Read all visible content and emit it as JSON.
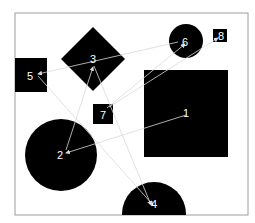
{
  "diagram": {
    "frame": {
      "x": 15,
      "y": 13,
      "width": 233,
      "height": 202,
      "stroke": "#9e9e9e"
    },
    "colors": {
      "shape_fill": "#000000",
      "label": "#ffffff",
      "edge": "#d9d9d9",
      "background": "#ffffff"
    },
    "nodes": [
      {
        "id": "1",
        "label": "1",
        "shape": "square",
        "x": 144,
        "y": 70,
        "w": 84,
        "h": 87,
        "lx": 186,
        "ly": 117
      },
      {
        "id": "2",
        "label": "2",
        "shape": "circle",
        "cx": 61,
        "cy": 155,
        "r": 36,
        "lx": 60,
        "ly": 159
      },
      {
        "id": "3",
        "label": "3",
        "shape": "diamond",
        "cx": 93,
        "cy": 59,
        "r": 32,
        "lx": 93,
        "ly": 63
      },
      {
        "id": "4",
        "label": "4",
        "shape": "circle",
        "cx": 154,
        "cy": 214,
        "r": 32,
        "lx": 154,
        "ly": 208
      },
      {
        "id": "5",
        "label": "5",
        "shape": "square",
        "x": 15,
        "y": 58,
        "w": 32,
        "h": 34,
        "lx": 30,
        "ly": 80
      },
      {
        "id": "6",
        "label": "6",
        "shape": "circle",
        "cx": 186,
        "cy": 41,
        "r": 17,
        "lx": 185,
        "ly": 46
      },
      {
        "id": "7",
        "label": "7",
        "shape": "square",
        "x": 93,
        "y": 104,
        "w": 20,
        "h": 20,
        "lx": 103,
        "ly": 119
      },
      {
        "id": "8",
        "label": "8",
        "shape": "square",
        "x": 213,
        "y": 29,
        "w": 14,
        "h": 13,
        "lx": 221,
        "ly": 40
      }
    ],
    "edges": [
      {
        "from": "1",
        "to": "2",
        "x1": 186,
        "y1": 115,
        "x2": 66,
        "y2": 153
      },
      {
        "from": "2",
        "to": "3",
        "x1": 66,
        "y1": 150,
        "x2": 93,
        "y2": 67
      },
      {
        "from": "6",
        "to": "5",
        "x1": 178,
        "y1": 42,
        "x2": 38,
        "y2": 74
      },
      {
        "from": "5",
        "to": "4",
        "x1": 38,
        "y1": 76,
        "x2": 153,
        "y2": 205
      },
      {
        "from": "3",
        "to": "4",
        "x1": 94,
        "y1": 66,
        "x2": 151,
        "y2": 205
      },
      {
        "from": "7",
        "to": "6",
        "x1": 107,
        "y1": 108,
        "x2": 185,
        "y2": 44
      },
      {
        "from": "7",
        "to": "8",
        "x1": 109,
        "y1": 107,
        "x2": 218,
        "y2": 38
      }
    ]
  }
}
